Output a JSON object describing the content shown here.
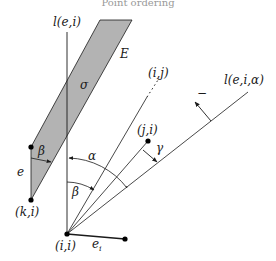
{
  "caption": "Point ordering",
  "labels": {
    "l_e_i": "l(e,i)",
    "E": "E",
    "sigma": "σ",
    "i_j": "(i,j)",
    "l_e_i_alpha": "l(e,i,α)",
    "minus": "−",
    "j_i": "(j,i)",
    "gamma": "γ",
    "alpha": "α",
    "beta_top": "β",
    "beta_bottom": "β",
    "e": "e",
    "k_i": "(k,i)",
    "i_i": "(i,i)",
    "e_i": "e",
    "e_i_sub": "i"
  },
  "colors": {
    "region_fill": "#b3b3b3",
    "stroke": "#1a1a1a",
    "point": "#000000"
  }
}
